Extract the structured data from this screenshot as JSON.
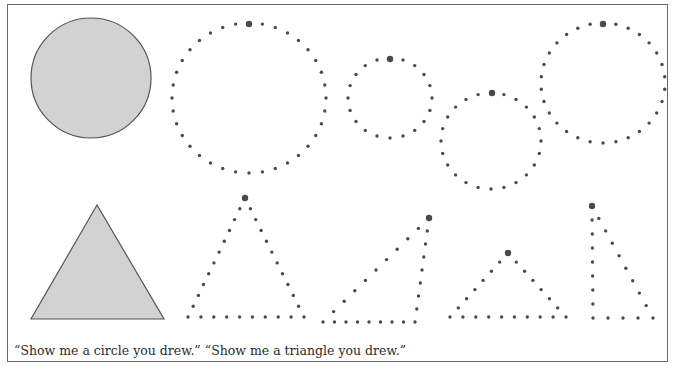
{
  "figure": {
    "caption": "“Show me a circle you drew.” “Show me a triangle you drew.”",
    "colors": {
      "frame": "#6a6a6a",
      "shape_fill": "#d2d2d2",
      "shape_stroke": "#555555",
      "dot": "#4a4a4a"
    },
    "model_shapes": [
      {
        "type": "circle",
        "label": "filled-circle",
        "cx": 91,
        "cy": 78,
        "r": 60
      },
      {
        "type": "triangle",
        "label": "filled-triangle",
        "points": [
          [
            97,
            205
          ],
          [
            31,
            319
          ],
          [
            164,
            319
          ]
        ]
      }
    ],
    "dotted_circles": [
      {
        "cx": 249,
        "cy": 98,
        "rx": 77,
        "ry": 75,
        "dots": 36,
        "start": [
          249,
          24
        ]
      },
      {
        "cx": 390,
        "cy": 98,
        "rx": 42,
        "ry": 40,
        "dots": 20,
        "start": [
          390,
          59
        ]
      },
      {
        "cx": 491,
        "cy": 141,
        "rx": 50,
        "ry": 48,
        "dots": 24,
        "start": [
          492,
          93
        ]
      },
      {
        "cx": 603,
        "cy": 83,
        "rx": 62,
        "ry": 60,
        "dots": 30,
        "start": [
          603,
          24
        ]
      }
    ],
    "dotted_triangles": [
      {
        "vertices": [
          [
            245,
            198
          ],
          [
            188,
            317
          ],
          [
            304,
            317
          ]
        ],
        "dots_per_side": [
          11,
          9,
          11
        ],
        "start": [
          245,
          198
        ]
      },
      {
        "vertices": [
          [
            429,
            218
          ],
          [
            323,
            322
          ],
          [
            415,
            322
          ]
        ],
        "dots_per_side": [
          10,
          8,
          8
        ],
        "start": [
          429,
          218
        ]
      },
      {
        "vertices": [
          [
            508,
            253
          ],
          [
            450,
            317
          ],
          [
            566,
            317
          ]
        ],
        "dots_per_side": [
          7,
          9,
          7
        ],
        "start": [
          508,
          253
        ]
      },
      {
        "vertices": [
          [
            592,
            206
          ],
          [
            593,
            318
          ],
          [
            653,
            318
          ]
        ],
        "dots_per_side": [
          8,
          4,
          9
        ],
        "start": [
          592,
          206
        ]
      }
    ]
  }
}
